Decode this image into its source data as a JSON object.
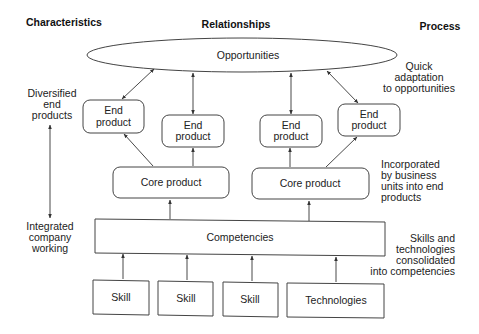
{
  "headers": {
    "characteristics": "Characteristics",
    "relationships": "Relationships",
    "process": "Process"
  },
  "nodes": {
    "opportunities": "Opportunities",
    "end_products": [
      {
        "line1": "End",
        "line2": "product"
      },
      {
        "line1": "End",
        "line2": "product"
      },
      {
        "line1": "End",
        "line2": "product"
      },
      {
        "line1": "End",
        "line2": "product"
      }
    ],
    "core_products": [
      "Core product",
      "Core product"
    ],
    "competencies": "Competencies",
    "inputs": [
      "Skill",
      "Skill",
      "Skill",
      "Technologies"
    ]
  },
  "characteristics": {
    "top": [
      "Diversified",
      "end",
      "products"
    ],
    "bottom": [
      "Integrated",
      "company",
      "working"
    ]
  },
  "process": {
    "step1": [
      "Quick",
      "adaptation",
      "to opportunities"
    ],
    "step2": [
      "Incorporated",
      "by business",
      "units into end",
      "products"
    ],
    "step3": [
      "Skills and",
      "technologies",
      "consolidated",
      "into competencies"
    ]
  }
}
